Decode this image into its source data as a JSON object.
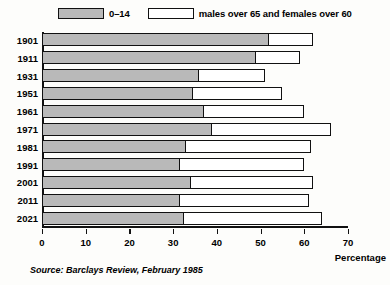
{
  "legend": {
    "entries": [
      {
        "label": "0–14",
        "swatch": "grey"
      },
      {
        "label": "males over 65 and females over 60",
        "swatch": "white"
      }
    ]
  },
  "source": "Source: Barclays Review, February 1985",
  "axis_title": "Percentage",
  "chart_data": {
    "type": "bar",
    "orientation": "horizontal",
    "stacked": true,
    "title": "",
    "xlabel": "Percentage",
    "ylabel": "",
    "xlim": [
      0,
      70
    ],
    "xticks": [
      0,
      10,
      20,
      30,
      40,
      50,
      60,
      70
    ],
    "grid": false,
    "legend_position": "top",
    "categories": [
      "1901",
      "1911",
      "1931",
      "1951",
      "1961",
      "1971",
      "1981",
      "1991",
      "2001",
      "2011",
      "2021"
    ],
    "series": [
      {
        "name": "0–14",
        "values": [
          52,
          49,
          36,
          34.5,
          37,
          39,
          33,
          31.5,
          34,
          31.5,
          32.5
        ]
      },
      {
        "name": "males over 65 and females over 60",
        "values": [
          10,
          10,
          15,
          20.5,
          23,
          27,
          28.5,
          28.5,
          28,
          29.5,
          31.5
        ]
      }
    ],
    "totals": [
      62,
      59,
      51,
      55,
      60,
      66,
      61.5,
      60,
      62,
      61,
      64
    ]
  }
}
